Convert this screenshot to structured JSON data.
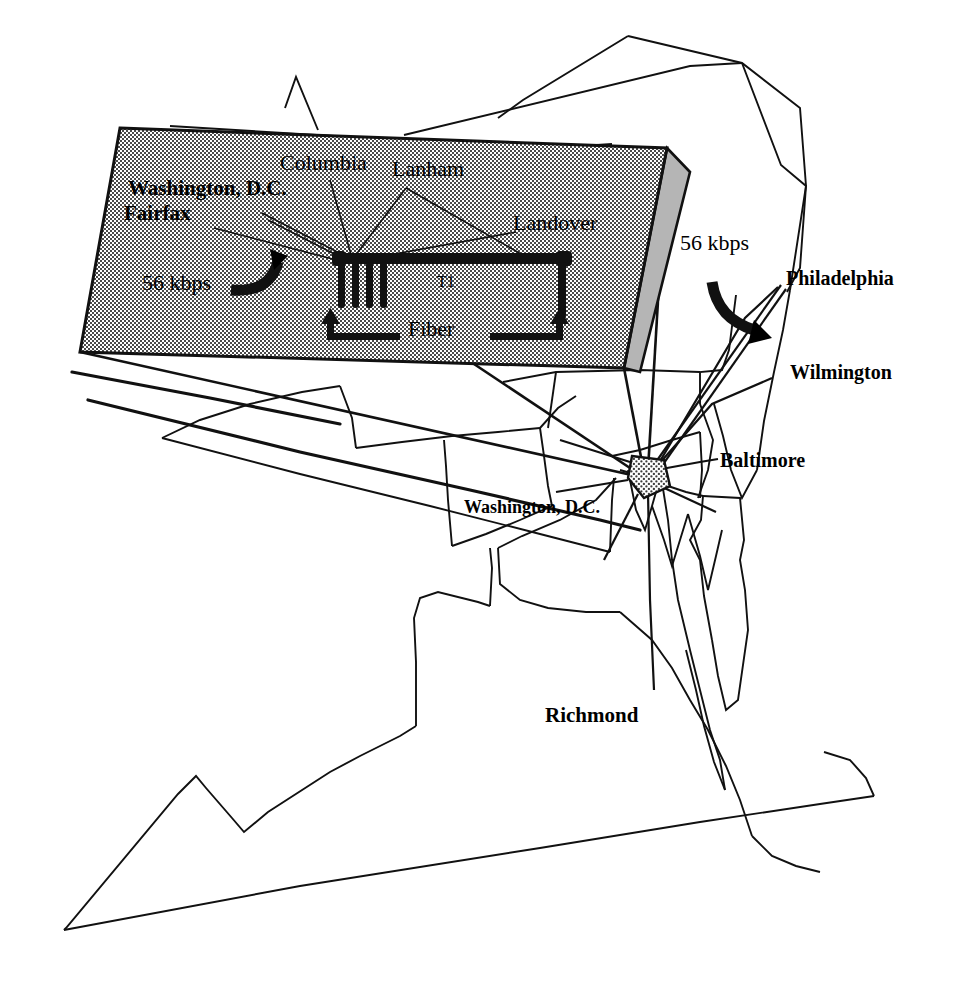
{
  "figure": {
    "kind": "network-topology-map",
    "region": "Mid-Atlantic / Washington D.C. metropolitan area"
  },
  "map_labels": {
    "philadelphia": "Philadelphia",
    "wilmington": "Wilmington",
    "baltimore": "Baltimore",
    "washington_dc": "Washington, D.C.",
    "richmond": "Richmond",
    "wan_link_rate": "56 kbps"
  },
  "inset": {
    "title_sites": [
      "Washington, D.C.",
      "Fairfax",
      "Columbia",
      "Lanham",
      "Landover"
    ],
    "site_washington_dc": "Washington, D.C.",
    "site_fairfax": "Fairfax",
    "site_columbia": "Columbia",
    "site_lanham": "Lanham",
    "site_landover": "Landover",
    "link_56kbps": "56 kbps",
    "link_t1": "T1",
    "link_fiber": "Fiber"
  },
  "colors": {
    "ink": "#000000",
    "paper": "#ffffff",
    "inset_fill": "#c9c9c9",
    "node_fill": "#bdbdbd",
    "border_line": "#111111"
  },
  "legend_semantics": {
    "56 kbps": "low-speed serial WAN link",
    "T1": "1.544 Mbps backbone link",
    "Fiber": "high-speed fiber span"
  }
}
